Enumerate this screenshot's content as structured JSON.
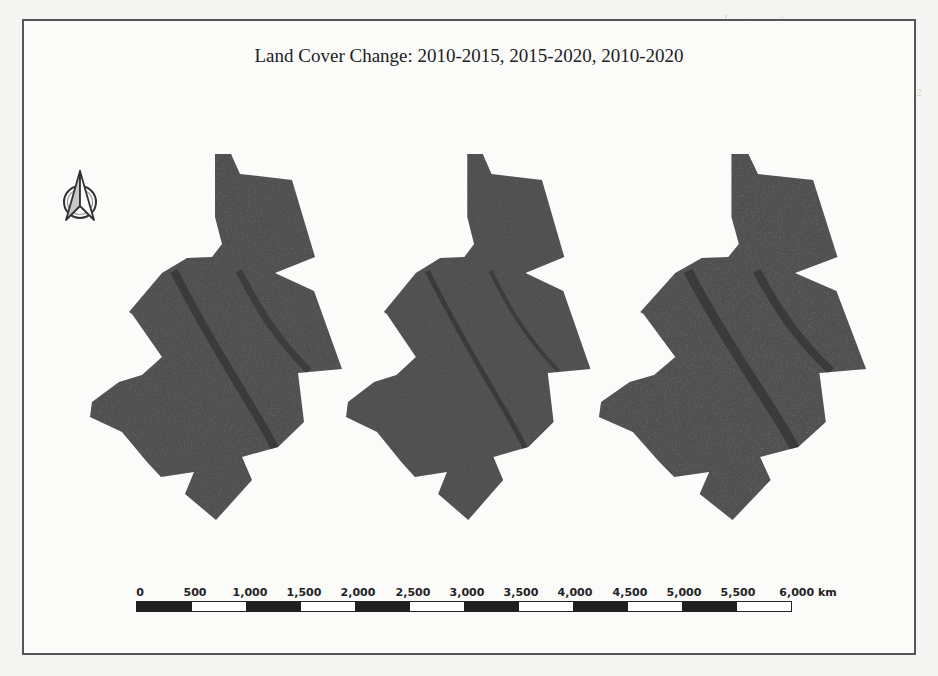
{
  "figure": {
    "title": "Land Cover Change: 2010-2015, 2015-2020, 2010-2020",
    "north_arrow": "north-arrow-icon",
    "maps": [
      {
        "label": "2010-2015",
        "fill": "#505050",
        "speckle": "#2e2e2e"
      },
      {
        "label": "2015-2020",
        "fill": "#505050",
        "speckle": "#2e2e2e"
      },
      {
        "label": "2010-2020",
        "fill": "#505050",
        "speckle": "#2e2e2e"
      }
    ],
    "scale_bar": {
      "unit": "km",
      "ticks": [
        "0",
        "500",
        "1,000",
        "1,500",
        "2,000",
        "2,500",
        "3,000",
        "3,500",
        "4,000",
        "4,500",
        "5,000",
        "5,500",
        "6,000 km"
      ]
    }
  },
  "background_bleed": {
    "lines": [
      "a hectares)",
      "built area (2010) = 1...",
      "built up area (2020) = ...",
      "Increase in built-up area = ... km²",
      "percentage increase = 73"
    ]
  },
  "colors": {
    "frame": "#555555",
    "map_fill": "#505050",
    "scale_dark": "#1f1f1f",
    "scale_light": "#ffffff",
    "text": "#222222"
  }
}
